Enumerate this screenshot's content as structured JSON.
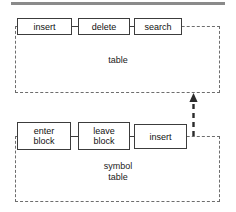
{
  "diagram": {
    "type": "module-dependency",
    "top_rule_color": "#8a8a8a",
    "module_border_color": "#6d6d6d",
    "box_border_color": "#3c3c3c",
    "text_color": "#111111",
    "modules": [
      {
        "id": "table",
        "label": "table",
        "operations": [
          {
            "id": "insert-table",
            "label": "insert"
          },
          {
            "id": "delete-table",
            "label": "delete"
          },
          {
            "id": "search-table",
            "label": "search"
          }
        ]
      },
      {
        "id": "symbol-table",
        "label": "symbol\ntable",
        "operations": [
          {
            "id": "enter-block",
            "label": "enter\nblock"
          },
          {
            "id": "leave-block",
            "label": "leave\nblock"
          },
          {
            "id": "insert-symbol",
            "label": "insert"
          }
        ]
      }
    ],
    "arrow": {
      "id": "uses-arrow",
      "style": "dashed",
      "direction": "up",
      "from_module": "symbol-table",
      "to_module": "table"
    }
  }
}
